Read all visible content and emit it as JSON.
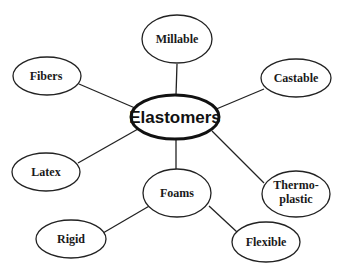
{
  "diagram": {
    "type": "mind-map",
    "center": {
      "label": "Elastomers"
    },
    "nodes": [
      {
        "id": "millable",
        "label": "Millable"
      },
      {
        "id": "fibers",
        "label": "Fibers"
      },
      {
        "id": "castable",
        "label": "Castable"
      },
      {
        "id": "latex",
        "label": "Latex"
      },
      {
        "id": "thermoplastic",
        "label_line1": "Thermo-",
        "label_line2": "plastic"
      },
      {
        "id": "foams",
        "label": "Foams"
      },
      {
        "id": "rigid",
        "label": "Rigid"
      },
      {
        "id": "flexible",
        "label": "Flexible"
      }
    ],
    "edges": [
      [
        "Elastomers",
        "Millable"
      ],
      [
        "Elastomers",
        "Fibers"
      ],
      [
        "Elastomers",
        "Castable"
      ],
      [
        "Elastomers",
        "Latex"
      ],
      [
        "Elastomers",
        "Thermoplastic"
      ],
      [
        "Elastomers",
        "Foams"
      ],
      [
        "Foams",
        "Rigid"
      ],
      [
        "Foams",
        "Flexible"
      ]
    ]
  }
}
